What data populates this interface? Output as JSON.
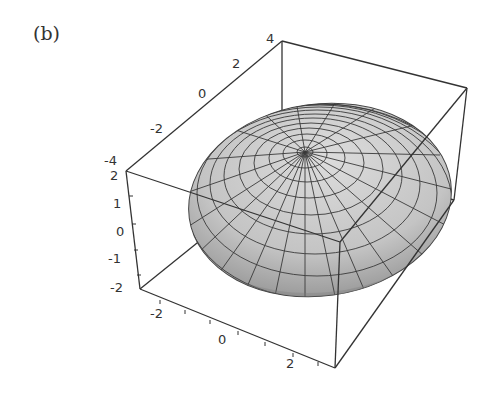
{
  "figure": {
    "panel_label": "(b)",
    "type": "3d-surface-plot",
    "surface": "ellipsoid",
    "surface_color": "#c8c8c8",
    "mesh_color": "#3a3a3a",
    "box_color": "#333333"
  },
  "axes": {
    "x_axis": {
      "ticks": [
        "-2",
        "0",
        "2"
      ],
      "range": [
        -3,
        3
      ]
    },
    "y_axis": {
      "ticks": [
        "-4",
        "-2",
        "0",
        "2",
        "4"
      ],
      "range": [
        -4,
        4
      ]
    },
    "z_axis": {
      "ticks": [
        "2",
        "1",
        "0",
        "-1",
        "-2"
      ],
      "range": [
        -2,
        2
      ]
    }
  },
  "labels": {
    "y_top": [
      "-4",
      "-2",
      "0",
      "2",
      "4"
    ],
    "z_left": [
      "2",
      "1",
      "0",
      "-1",
      "-2"
    ],
    "x_bottom": [
      "-2",
      "0",
      "2"
    ]
  }
}
